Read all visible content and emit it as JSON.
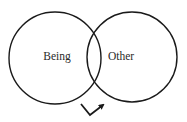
{
  "diagram": {
    "type": "venn",
    "circles": [
      {
        "id": "left",
        "label": "Being"
      },
      {
        "id": "right",
        "label": "Other"
      }
    ],
    "arrow": {
      "description": "checkmark-shaped arrow below intersection pointing up-right"
    },
    "colors": {
      "stroke": "#1a1a1a",
      "text": "#2a2a2a",
      "background": "#ffffff"
    }
  }
}
